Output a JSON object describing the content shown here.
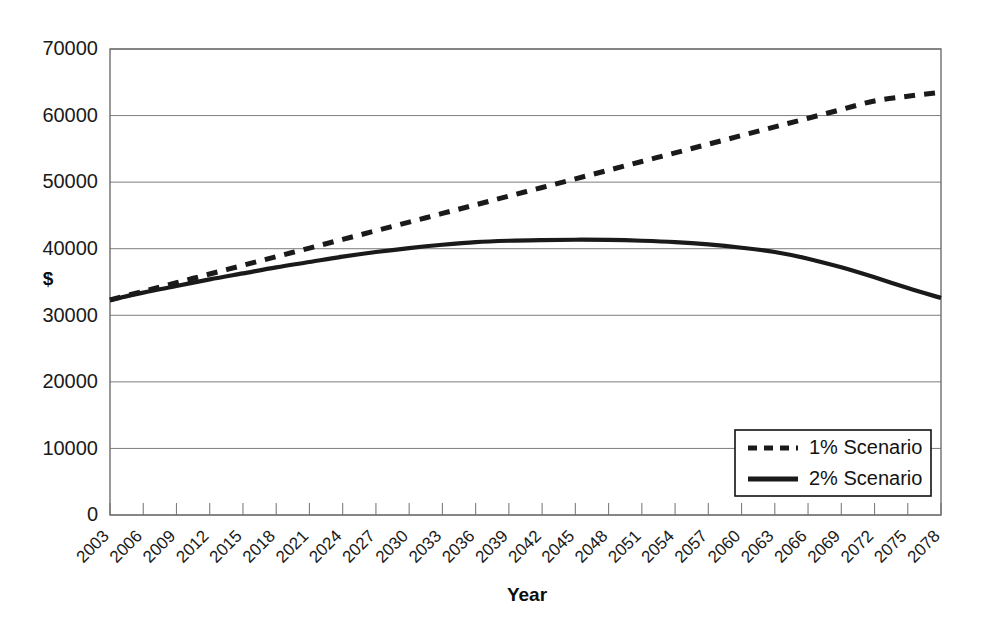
{
  "chart_data": {
    "type": "line",
    "title": "",
    "xlabel": "Year",
    "ylabel": "$",
    "ylim": [
      0,
      70000
    ],
    "ytick_values": [
      0,
      10000,
      20000,
      30000,
      40000,
      50000,
      60000,
      70000
    ],
    "ytick_labels": [
      "0",
      "10000",
      "20000",
      "30000",
      "40000",
      "50000",
      "60000",
      "70000"
    ],
    "grid": true,
    "legend_position": "bottom-right",
    "x": [
      2003,
      2006,
      2009,
      2012,
      2015,
      2018,
      2021,
      2024,
      2027,
      2030,
      2033,
      2036,
      2039,
      2042,
      2045,
      2048,
      2051,
      2054,
      2057,
      2060,
      2063,
      2066,
      2069,
      2072,
      2075,
      2078
    ],
    "categories": [
      "2003",
      "2006",
      "2009",
      "2012",
      "2015",
      "2018",
      "2021",
      "2024",
      "2027",
      "2030",
      "2033",
      "2036",
      "2039",
      "2042",
      "2045",
      "2048",
      "2051",
      "2054",
      "2057",
      "2060",
      "2063",
      "2066",
      "2069",
      "2072",
      "2075",
      "2078"
    ],
    "series": [
      {
        "name": "1% Scenario",
        "style": "dashed",
        "color": "#1a1a1a",
        "values": [
          32300,
          33600,
          34900,
          36200,
          37500,
          38800,
          40100,
          41400,
          42700,
          44000,
          45300,
          46600,
          47900,
          49200,
          50500,
          51800,
          53100,
          54400,
          55700,
          57000,
          58300,
          59600,
          60900,
          62200,
          62900,
          63500
        ]
      },
      {
        "name": "2% Scenario",
        "style": "solid",
        "color": "#1a1a1a",
        "values": [
          32300,
          33400,
          34400,
          35400,
          36300,
          37200,
          38000,
          38800,
          39500,
          40100,
          40600,
          41000,
          41200,
          41300,
          41350,
          41320,
          41200,
          41000,
          40650,
          40150,
          39500,
          38500,
          37200,
          35700,
          34100,
          32600
        ]
      }
    ]
  },
  "legend": {
    "entries": [
      {
        "label": "1% Scenario",
        "style": "dashed"
      },
      {
        "label": "2% Scenario",
        "style": "solid"
      }
    ]
  },
  "axes": {
    "y_title": "$",
    "x_title": "Year"
  }
}
